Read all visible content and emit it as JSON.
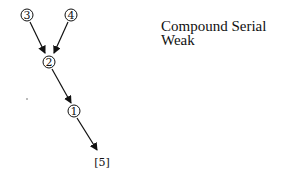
{
  "title": {
    "line1": "Compound Serial",
    "line2": "Weak"
  },
  "nodes": [
    {
      "id": "n3",
      "label": "3",
      "style": "circled",
      "x": 27,
      "y": 15
    },
    {
      "id": "n4",
      "label": "4",
      "style": "circled",
      "x": 71,
      "y": 15
    },
    {
      "id": "n2",
      "label": "2",
      "style": "circled",
      "x": 49,
      "y": 62
    },
    {
      "id": "n1",
      "label": "1",
      "style": "circled",
      "x": 74,
      "y": 111
    },
    {
      "id": "n5",
      "label": "[5]",
      "style": "bracketed",
      "x": 102,
      "y": 162
    }
  ],
  "edges": [
    {
      "from": "3",
      "to": "2"
    },
    {
      "from": "4",
      "to": "2"
    },
    {
      "from": "2",
      "to": "1"
    },
    {
      "from": "1",
      "to": "[5]"
    }
  ]
}
